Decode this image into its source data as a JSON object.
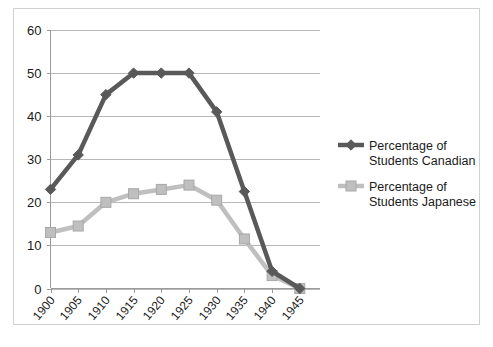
{
  "chart_data": {
    "type": "line",
    "title": "",
    "subtitle": "",
    "xlabel": "",
    "ylabel": "",
    "grid": true,
    "legend_position": "right",
    "categories": [
      "1900",
      "1905",
      "1910",
      "1915",
      "1920",
      "1925",
      "1930",
      "1935",
      "1940",
      "1945"
    ],
    "x": [
      1900,
      1905,
      1910,
      1915,
      1920,
      1925,
      1930,
      1935,
      1940,
      1945
    ],
    "xlim": [
      1900,
      1945
    ],
    "ylim": [
      0,
      60
    ],
    "y_ticks": [
      "0",
      "10",
      "20",
      "30",
      "40",
      "50",
      "60"
    ],
    "y_tick_values": [
      0,
      10,
      20,
      30,
      40,
      50,
      60
    ],
    "series": [
      {
        "name": "Percentage of Students Canadian",
        "color": "#595959",
        "marker": "diamond",
        "values": [
          23,
          31,
          45,
          50,
          50,
          50,
          41,
          22.5,
          4,
          0
        ]
      },
      {
        "name": "Percentage of Students Japanese",
        "color": "#bfbfbf",
        "marker": "square",
        "values": [
          13,
          14.5,
          20,
          22,
          23,
          24,
          20.5,
          11.5,
          3,
          0
        ]
      }
    ]
  },
  "legend": {
    "entries": [
      {
        "label_line1": "Percentage of",
        "label_line2": "Students Canadian",
        "color": "#595959",
        "marker": "diamond"
      },
      {
        "label_line1": "Percentage of",
        "label_line2": "Students Japanese",
        "color": "#bfbfbf",
        "marker": "square"
      }
    ]
  },
  "colors": {
    "canadian": "#595959",
    "japanese": "#bfbfbf",
    "gridline": "#b8b8b8",
    "axis": "#9a9a9a",
    "frame": "#d0d0d0",
    "text": "#1a1a1a",
    "background": "#ffffff"
  }
}
